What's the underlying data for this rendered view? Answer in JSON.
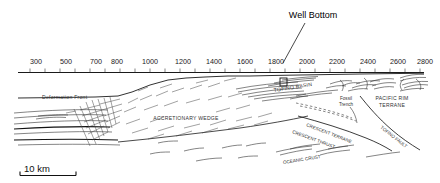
{
  "figure": {
    "type": "geologic-cross-section",
    "title_callout": "Well Bottom",
    "background_color": "#ffffff",
    "line_color": "#1a1a1a"
  },
  "distance_axis": {
    "name": "distance-axis",
    "orientation": "horizontal",
    "minor_tick_interval": 100,
    "range": [
      250,
      2850
    ],
    "labels": [
      {
        "value": 300,
        "text": "300"
      },
      {
        "value": 500,
        "text": "500"
      },
      {
        "value": 700,
        "text": "700"
      },
      {
        "value": 800,
        "text": "800"
      },
      {
        "value": 1000,
        "text": "1000"
      },
      {
        "value": 1200,
        "text": "1200"
      },
      {
        "value": 1400,
        "text": "1400"
      },
      {
        "value": 1600,
        "text": "1600"
      },
      {
        "value": 1800,
        "text": "1800"
      },
      {
        "value": 2000,
        "text": "2000"
      },
      {
        "value": 2200,
        "text": "2200"
      },
      {
        "value": 2400,
        "text": "2400"
      },
      {
        "value": 2600,
        "text": "2600"
      },
      {
        "value": 2800,
        "text": "2800"
      }
    ]
  },
  "annotations": {
    "well_bottom": {
      "label": "Well Bottom",
      "marker": "square-box",
      "pointer_target_value": 2200
    },
    "deformation_front": "Deformation Front",
    "accretionary_wedge": "ACCRETIONARY WEDGE",
    "tofino_basin": "TOFINO BASIN",
    "crescent_thrust": "CRESCENT THRUST",
    "crescent_terrane": "CRESCENT TERRANE",
    "fossil_trench_line1": "Fossil",
    "fossil_trench_line2": "Trench",
    "pacific_rim_line1": "PACIFIC RIM",
    "pacific_rim_line2": "TERRANE",
    "tofino_fault": "TOFINO FAULT",
    "oceanic_crust": "OCEANIC CRUST"
  },
  "scale_bar": {
    "label": "10 km",
    "length_km": 10
  }
}
